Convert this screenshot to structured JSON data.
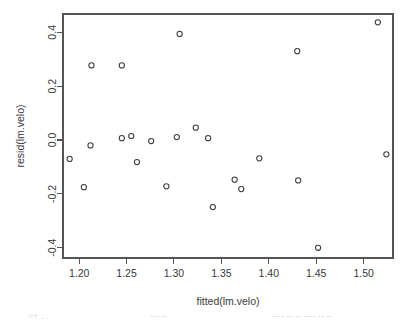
{
  "figure": {
    "background_color": "#ffffff",
    "axis_color": "#555555",
    "point_color": "#3c3c3c",
    "plot_box": {
      "left": 63,
      "top": 14,
      "right": 393,
      "bottom": 258
    }
  },
  "footer": {
    "fragment_left": "=+ . .",
    "fragment_mid": "--- --",
    "fragment_right": "---- -- -- ---- -- --"
  },
  "chart_data": {
    "type": "scatter",
    "title": "",
    "xlabel": "fitted(lm.velo)",
    "ylabel": "resid(lm.velo)",
    "xlim": [
      1.183,
      1.531
    ],
    "ylim": [
      -0.438,
      0.468
    ],
    "xticks": [
      1.2,
      1.25,
      1.3,
      1.35,
      1.4,
      1.45,
      1.5
    ],
    "xticklabels": [
      "1.20",
      "1.25",
      "1.30",
      "1.35",
      "1.40",
      "1.45",
      "1.50"
    ],
    "yticks": [
      0.4,
      0.2,
      0.0,
      -0.2,
      -0.4
    ],
    "yticklabels": [
      "0.4",
      "0.2",
      "0.0",
      "-0.2",
      "-0.4"
    ],
    "grid": false,
    "legend": null,
    "marker": "open-circle",
    "marker_radius": 2.6,
    "points": [
      {
        "x": 1.19,
        "y": -0.07
      },
      {
        "x": 1.205,
        "y": -0.175
      },
      {
        "x": 1.212,
        "y": -0.02
      },
      {
        "x": 1.213,
        "y": 0.277
      },
      {
        "x": 1.245,
        "y": 0.277
      },
      {
        "x": 1.245,
        "y": 0.007
      },
      {
        "x": 1.255,
        "y": 0.015
      },
      {
        "x": 1.261,
        "y": -0.082
      },
      {
        "x": 1.276,
        "y": -0.004
      },
      {
        "x": 1.292,
        "y": -0.172
      },
      {
        "x": 1.303,
        "y": 0.011
      },
      {
        "x": 1.306,
        "y": 0.394
      },
      {
        "x": 1.323,
        "y": 0.046
      },
      {
        "x": 1.336,
        "y": 0.007
      },
      {
        "x": 1.341,
        "y": -0.249
      },
      {
        "x": 1.364,
        "y": -0.147
      },
      {
        "x": 1.371,
        "y": -0.182
      },
      {
        "x": 1.39,
        "y": -0.068
      },
      {
        "x": 1.43,
        "y": 0.33
      },
      {
        "x": 1.431,
        "y": -0.15
      },
      {
        "x": 1.452,
        "y": -0.4
      },
      {
        "x": 1.515,
        "y": 0.437
      },
      {
        "x": 1.524,
        "y": -0.053
      }
    ]
  }
}
